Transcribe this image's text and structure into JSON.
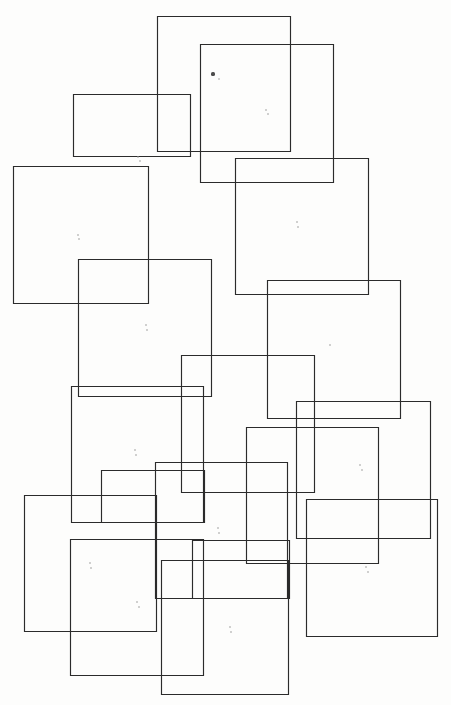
{
  "figure": {
    "title": "Overlapping rectangles composition",
    "canvas": {
      "width": 451,
      "height": 705
    },
    "background_color": "#fdfdfc",
    "stroke_color": "#2b2b2b",
    "stroke_width": 1.15,
    "fill": "none",
    "shape_count": 18
  },
  "chart_data": {
    "type": "scatter",
    "title": "Overlapping rectangles composition",
    "xlabel": "",
    "ylabel": "",
    "xlim": [
      0,
      451
    ],
    "ylim": [
      0,
      705
    ],
    "grid": false,
    "legend": "none",
    "rectangles": [
      {
        "id": "rect-1",
        "x": 157,
        "y": 16,
        "width": 133,
        "height": 135
      },
      {
        "id": "rect-2",
        "x": 200,
        "y": 44,
        "width": 133,
        "height": 138
      },
      {
        "id": "rect-3",
        "x": 73,
        "y": 94,
        "width": 117,
        "height": 62
      },
      {
        "id": "rect-4",
        "x": 235,
        "y": 158,
        "width": 133,
        "height": 136
      },
      {
        "id": "rect-5",
        "x": 13,
        "y": 166,
        "width": 135,
        "height": 137
      },
      {
        "id": "rect-6",
        "x": 78,
        "y": 259,
        "width": 133,
        "height": 137
      },
      {
        "id": "rect-7",
        "x": 267,
        "y": 280,
        "width": 133,
        "height": 138
      },
      {
        "id": "rect-8",
        "x": 181,
        "y": 355,
        "width": 133,
        "height": 137
      },
      {
        "id": "rect-9",
        "x": 71,
        "y": 386,
        "width": 132,
        "height": 136
      },
      {
        "id": "rect-10",
        "x": 296,
        "y": 401,
        "width": 134,
        "height": 137
      },
      {
        "id": "rect-11",
        "x": 246,
        "y": 427,
        "width": 132,
        "height": 136
      },
      {
        "id": "rect-12",
        "x": 155,
        "y": 462,
        "width": 132,
        "height": 136
      },
      {
        "id": "rect-13",
        "x": 24,
        "y": 495,
        "width": 132,
        "height": 136
      },
      {
        "id": "rect-14",
        "x": 306,
        "y": 499,
        "width": 131,
        "height": 137
      },
      {
        "id": "rect-15",
        "x": 70,
        "y": 539,
        "width": 133,
        "height": 136
      },
      {
        "id": "rect-16",
        "x": 161,
        "y": 560,
        "width": 127,
        "height": 134
      },
      {
        "id": "rect-17",
        "x": 192,
        "y": 540,
        "width": 97,
        "height": 58
      },
      {
        "id": "rect-18",
        "x": 101,
        "y": 470,
        "width": 103,
        "height": 52
      }
    ],
    "specks": [
      {
        "x": 213,
        "y": 74,
        "size": 3.2,
        "tone": "dark"
      },
      {
        "x": 219,
        "y": 79,
        "size": 1.8,
        "tone": "light"
      },
      {
        "x": 266,
        "y": 110,
        "size": 1.6,
        "tone": "light"
      },
      {
        "x": 268,
        "y": 114,
        "size": 1.6,
        "tone": "light"
      },
      {
        "x": 138,
        "y": 157,
        "size": 1.6,
        "tone": "light"
      },
      {
        "x": 140,
        "y": 161,
        "size": 1.6,
        "tone": "light"
      },
      {
        "x": 78,
        "y": 235,
        "size": 1.6,
        "tone": "light"
      },
      {
        "x": 79,
        "y": 239,
        "size": 1.6,
        "tone": "light"
      },
      {
        "x": 297,
        "y": 222,
        "size": 1.6,
        "tone": "light"
      },
      {
        "x": 298,
        "y": 227,
        "size": 1.6,
        "tone": "light"
      },
      {
        "x": 146,
        "y": 325,
        "size": 1.6,
        "tone": "light"
      },
      {
        "x": 147,
        "y": 330,
        "size": 1.6,
        "tone": "light"
      },
      {
        "x": 330,
        "y": 345,
        "size": 1.6,
        "tone": "light"
      },
      {
        "x": 135,
        "y": 450,
        "size": 1.6,
        "tone": "light"
      },
      {
        "x": 136,
        "y": 455,
        "size": 1.6,
        "tone": "light"
      },
      {
        "x": 360,
        "y": 465,
        "size": 1.6,
        "tone": "light"
      },
      {
        "x": 362,
        "y": 470,
        "size": 1.6,
        "tone": "light"
      },
      {
        "x": 218,
        "y": 528,
        "size": 1.6,
        "tone": "light"
      },
      {
        "x": 219,
        "y": 533,
        "size": 1.6,
        "tone": "light"
      },
      {
        "x": 90,
        "y": 563,
        "size": 1.6,
        "tone": "light"
      },
      {
        "x": 91,
        "y": 568,
        "size": 1.6,
        "tone": "light"
      },
      {
        "x": 366,
        "y": 567,
        "size": 1.6,
        "tone": "light"
      },
      {
        "x": 368,
        "y": 572,
        "size": 1.6,
        "tone": "light"
      },
      {
        "x": 137,
        "y": 602,
        "size": 1.6,
        "tone": "light"
      },
      {
        "x": 139,
        "y": 607,
        "size": 1.6,
        "tone": "light"
      },
      {
        "x": 230,
        "y": 627,
        "size": 1.6,
        "tone": "light"
      },
      {
        "x": 231,
        "y": 632,
        "size": 1.6,
        "tone": "light"
      }
    ]
  }
}
